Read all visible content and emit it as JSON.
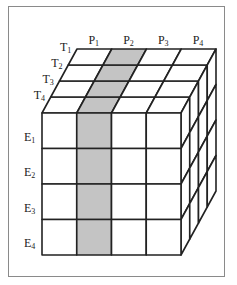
{
  "diagram": {
    "title": "",
    "colors": {
      "line": "#222222",
      "shade": "#c4c4c4",
      "face": "#ffffff",
      "frame": "#8a8a8a"
    },
    "shaded_column": 1,
    "p_labels": [
      {
        "base": "P",
        "sub": "1"
      },
      {
        "base": "P",
        "sub": "2"
      },
      {
        "base": "P",
        "sub": "3"
      },
      {
        "base": "P",
        "sub": "4"
      }
    ],
    "t_labels": [
      {
        "base": "T",
        "sub": "1"
      },
      {
        "base": "T",
        "sub": "2"
      },
      {
        "base": "T",
        "sub": "3"
      },
      {
        "base": "T",
        "sub": "4"
      }
    ],
    "e_labels": [
      {
        "base": "E",
        "sub": "1"
      },
      {
        "base": "E",
        "sub": "2"
      },
      {
        "base": "E",
        "sub": "3"
      },
      {
        "base": "E",
        "sub": "4"
      }
    ]
  }
}
